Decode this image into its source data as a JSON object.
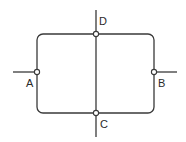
{
  "diagram": {
    "type": "circuit-network",
    "stroke_color": "#3a3a3a",
    "background": "#ffffff",
    "loop": {
      "x": 37,
      "y": 34,
      "width": 117,
      "height": 79,
      "corner_radius": 6
    },
    "center_wire": {
      "x": 96,
      "y1": 10,
      "y2": 137
    },
    "leads": [
      {
        "name": "left-lead",
        "x1": 13,
        "y1": 72,
        "x2": 37,
        "y2": 72
      },
      {
        "name": "right-lead",
        "x1": 154,
        "y1": 72,
        "x2": 177,
        "y2": 72
      }
    ],
    "nodes": [
      {
        "id": "A",
        "label": "A",
        "cx": 37,
        "cy": 72,
        "label_x": 26,
        "label_y": 87
      },
      {
        "id": "B",
        "label": "B",
        "cx": 154,
        "cy": 72,
        "label_x": 158,
        "label_y": 87
      },
      {
        "id": "C",
        "label": "C",
        "cx": 96,
        "cy": 113,
        "label_x": 100,
        "label_y": 128
      },
      {
        "id": "D",
        "label": "D",
        "cx": 96,
        "cy": 34,
        "label_x": 99,
        "label_y": 25
      }
    ]
  }
}
